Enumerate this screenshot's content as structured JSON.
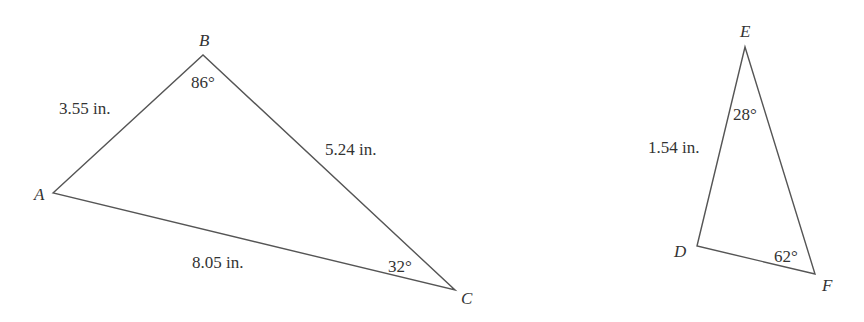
{
  "diagram": {
    "triangles": [
      {
        "name": "ABC",
        "vertices": {
          "A": {
            "label": "A",
            "x": 53,
            "y": 193
          },
          "B": {
            "label": "B",
            "x": 203,
            "y": 55
          },
          "C": {
            "label": "C",
            "x": 455,
            "y": 290
          }
        },
        "sides": {
          "AB": "3.55 in.",
          "BC": "5.24 in.",
          "AC": "8.05 in."
        },
        "angles": {
          "B": "86°",
          "C": "32°"
        }
      },
      {
        "name": "DEF",
        "vertices": {
          "D": {
            "label": "D",
            "x": 697,
            "y": 246
          },
          "E": {
            "label": "E",
            "x": 745,
            "y": 47
          },
          "F": {
            "label": "F",
            "x": 815,
            "y": 274
          }
        },
        "sides": {
          "DE": "1.54 in."
        },
        "angles": {
          "E": "28°",
          "F": "62°"
        }
      }
    ],
    "colors": {
      "stroke": "#555555",
      "text": "#333333",
      "background": "#ffffff"
    }
  }
}
